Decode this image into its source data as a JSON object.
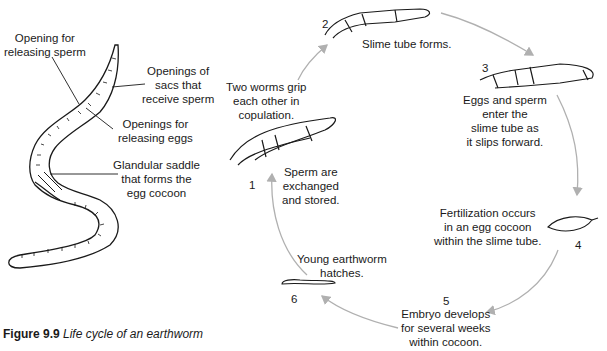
{
  "figure": {
    "caption_label": "Figure 9.9",
    "caption_text": "Life cycle of an earthworm"
  },
  "anatomy_labels": {
    "opening_sperm": [
      "Opening for",
      "releasing sperm"
    ],
    "openings_sacs": [
      "Openings of",
      "sacs that",
      "receive sperm"
    ],
    "openings_eggs": [
      "Openings for",
      "releasing eggs"
    ],
    "saddle": [
      "Glandular saddle",
      "that forms the",
      "egg cocoon"
    ]
  },
  "cycle": {
    "stages": [
      {
        "number": "1",
        "text": [
          "Two worms grip",
          "each other in",
          "copulation."
        ],
        "text2": [
          "Sperm are",
          "exchanged",
          "and stored."
        ]
      },
      {
        "number": "2",
        "text": [
          "Slime tube forms."
        ]
      },
      {
        "number": "3",
        "text": [
          "Eggs and sperm",
          "enter the",
          "slime tube as",
          "it slips forward."
        ]
      },
      {
        "number": "4",
        "text": [
          "Fertilization occurs",
          "in an egg cocoon",
          "within the slime tube."
        ]
      },
      {
        "number": "5",
        "text": [
          "Embryo develops",
          "for several weeks",
          "within cocoon."
        ]
      },
      {
        "number": "6",
        "text": [
          "Young earthworm",
          "hatches."
        ]
      }
    ]
  },
  "colors": {
    "ink": "#1a1a1a",
    "arrow": "#b0b0b0"
  }
}
